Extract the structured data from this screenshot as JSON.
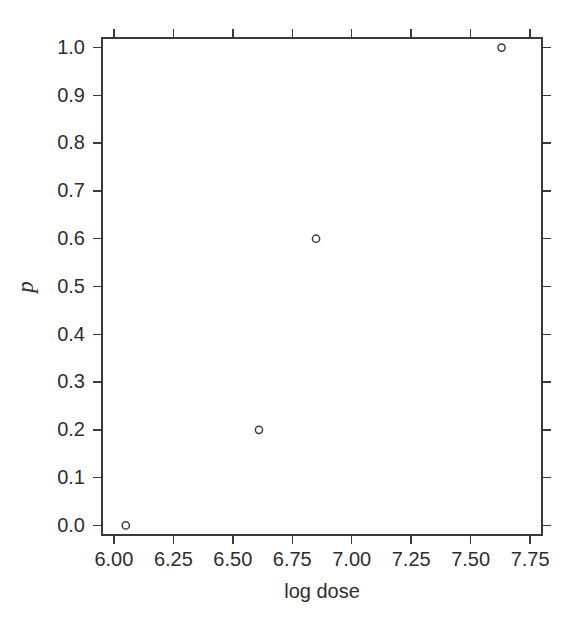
{
  "figure": {
    "background_color": "#ffffff",
    "foreground_color": "#3a3a3a",
    "marker_color": "#3d3d3d"
  },
  "chart_data": {
    "type": "scatter",
    "title": "",
    "xlabel": "log dose",
    "ylabel": "p",
    "xlim": [
      5.95,
      7.8
    ],
    "ylim": [
      -0.02,
      1.02
    ],
    "grid": false,
    "legend": null,
    "marker": "open-circle",
    "x": [
      6.05,
      6.61,
      6.85,
      7.63
    ],
    "y": [
      0.0,
      0.2,
      0.6,
      1.0
    ],
    "points": [
      {
        "x": 6.05,
        "y": 0.0
      },
      {
        "x": 6.61,
        "y": 0.2
      },
      {
        "x": 6.85,
        "y": 0.6
      },
      {
        "x": 7.63,
        "y": 1.0
      }
    ],
    "xticks": [
      6.0,
      6.25,
      6.5,
      6.75,
      7.0,
      7.25,
      7.5,
      7.75
    ],
    "xticklabels": [
      "6.00",
      "6.25",
      "6.50",
      "6.75",
      "7.00",
      "7.25",
      "7.50",
      "7.75"
    ],
    "yticks": [
      0.0,
      0.1,
      0.2,
      0.3,
      0.4,
      0.5,
      0.6,
      0.7,
      0.8,
      0.9,
      1.0
    ],
    "yticklabels": [
      "0.0",
      "0.1",
      "0.2",
      "0.3",
      "0.4",
      "0.5",
      "0.6",
      "0.7",
      "0.8",
      "0.9",
      "1.0"
    ]
  }
}
